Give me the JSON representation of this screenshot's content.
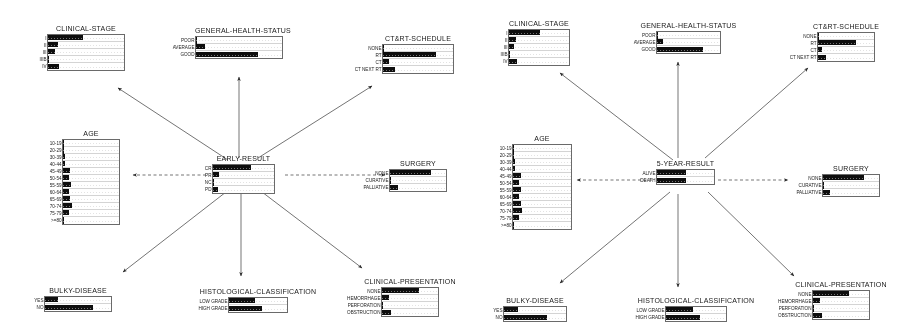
{
  "chart_data": {
    "type": "bar",
    "grid": false,
    "legend_position": "none",
    "panels": [
      {
        "panel_id": "early-result-network",
        "center_node": "EARLY-RESULT",
        "nodes": [
          {
            "name": "CLINICAL-STAGE",
            "categories": [
              "I",
              "II",
              "III",
              "IIIB",
              "IV"
            ],
            "values": [
              0.46,
              0.13,
              0.09,
              0.02,
              0.14
            ],
            "ylim": [
              0,
              1
            ]
          },
          {
            "name": "GENERAL-HEALTH-STATUS",
            "categories": [
              "POOR",
              "AVERAGE",
              "GOOD"
            ],
            "values": [
              0.02,
              0.1,
              0.72
            ],
            "ylim": [
              0,
              1
            ]
          },
          {
            "name": "CT&RT-SCHEDULE",
            "categories": [
              "NONE",
              "RT",
              "CT",
              "CT NEXT RT"
            ],
            "values": [
              0.02,
              0.76,
              0.09,
              0.17
            ],
            "ylim": [
              0,
              1
            ]
          },
          {
            "name": "AGE",
            "categories": [
              "10-19",
              "20-29",
              "30-39",
              "40-44",
              "45-49",
              "50-54",
              "55-59",
              "60-64",
              "65-69",
              "70-74",
              "75-79",
              ">=80"
            ],
            "values": [
              0.02,
              0.02,
              0.04,
              0.04,
              0.13,
              0.11,
              0.14,
              0.1,
              0.13,
              0.16,
              0.1,
              0.02
            ],
            "ylim": [
              0,
              1
            ]
          },
          {
            "name": "EARLY-RESULT",
            "categories": [
              "CR",
              "PR",
              "NC",
              "PD"
            ],
            "values": [
              0.62,
              0.1,
              0.03,
              0.09
            ],
            "ylim": [
              0,
              1
            ]
          },
          {
            "name": "SURGERY",
            "categories": [
              "NONE",
              "CURATIVE",
              "PALLIATIVE"
            ],
            "values": [
              0.74,
              0.03,
              0.14
            ],
            "ylim": [
              0,
              1
            ]
          },
          {
            "name": "BULKY-DISEASE",
            "categories": [
              "YES",
              "NO"
            ],
            "values": [
              0.2,
              0.72
            ],
            "ylim": [
              0,
              1
            ]
          },
          {
            "name": "HISTOLOGICAL-CLASSIFICATION",
            "categories": [
              "LOW GRADE",
              "HIGH GRADE"
            ],
            "values": [
              0.45,
              0.57
            ],
            "ylim": [
              0,
              1
            ]
          },
          {
            "name": "CLINICAL-PRESENTATION",
            "categories": [
              "NONE",
              "HEMORRHAGE",
              "PERFORATION",
              "OBSTRUCTION"
            ],
            "values": [
              0.66,
              0.13,
              0.02,
              0.16
            ],
            "ylim": [
              0,
              1
            ]
          }
        ]
      },
      {
        "panel_id": "five-year-result-network",
        "center_node": "5-YEAR-RESULT",
        "nodes": [
          {
            "name": "CLINICAL-STAGE",
            "categories": [
              "I",
              "II",
              "III",
              "IIIB",
              "IV"
            ],
            "values": [
              0.52,
              0.12,
              0.09,
              0.02,
              0.14
            ],
            "ylim": [
              0,
              1
            ]
          },
          {
            "name": "GENERAL-HEALTH-STATUS",
            "categories": [
              "POOR",
              "AVERAGE",
              "GOOD"
            ],
            "values": [
              0.02,
              0.09,
              0.73
            ],
            "ylim": [
              0,
              1
            ]
          },
          {
            "name": "CT&RT-SCHEDULE",
            "categories": [
              "NONE",
              "RT",
              "CT",
              "CT NEXT RT"
            ],
            "values": [
              0.02,
              0.67,
              0.08,
              0.15
            ],
            "ylim": [
              0,
              1
            ]
          },
          {
            "name": "AGE",
            "categories": [
              "10-19",
              "20-29",
              "30-39",
              "40-44",
              "45-49",
              "50-54",
              "55-59",
              "60-64",
              "65-69",
              "70-74",
              "75-79",
              ">=80"
            ],
            "values": [
              0.02,
              0.02,
              0.04,
              0.04,
              0.13,
              0.11,
              0.14,
              0.1,
              0.13,
              0.16,
              0.1,
              0.02
            ],
            "ylim": [
              0,
              1
            ]
          },
          {
            "name": "5-YEAR-RESULT",
            "categories": [
              "ALIVE",
              "DEATH"
            ],
            "values": [
              0.5,
              0.5
            ],
            "ylim": [
              0,
              1
            ]
          },
          {
            "name": "SURGERY",
            "categories": [
              "NONE",
              "CURATIVE",
              "PALLIATIVE"
            ],
            "values": [
              0.74,
              0.03,
              0.13
            ],
            "ylim": [
              0,
              1
            ]
          },
          {
            "name": "BULKY-DISEASE",
            "categories": [
              "YES",
              "NO"
            ],
            "values": [
              0.22,
              0.7
            ],
            "ylim": [
              0,
              1
            ]
          },
          {
            "name": "HISTOLOGICAL-CLASSIFICATION",
            "categories": [
              "LOW GRADE",
              "HIGH GRADE"
            ],
            "values": [
              0.45,
              0.57
            ],
            "ylim": [
              0,
              1
            ]
          },
          {
            "name": "CLINICAL-PRESENTATION",
            "categories": [
              "NONE",
              "HEMORRHAGE",
              "PERFORATION",
              "OBSTRUCTION"
            ],
            "values": [
              0.64,
              0.13,
              0.02,
              0.16
            ],
            "ylim": [
              0,
              1
            ]
          }
        ]
      }
    ]
  },
  "panels": [
    {
      "id": "left",
      "center": {
        "title": "EARLY-RESULT",
        "rows": [
          {
            "label": "CR",
            "value": 0.62
          },
          {
            "label": "PR",
            "value": 0.1
          },
          {
            "label": "NC",
            "value": 0.03
          },
          {
            "label": "PD",
            "value": 0.09
          }
        ]
      },
      "clinical_stage": {
        "title": "CLINICAL-STAGE",
        "rows": [
          {
            "label": "I",
            "value": 0.46
          },
          {
            "label": "II",
            "value": 0.13
          },
          {
            "label": "III",
            "value": 0.09
          },
          {
            "label": "IIIB",
            "value": 0.02
          },
          {
            "label": "IV",
            "value": 0.14
          }
        ]
      },
      "general_health": {
        "title": "GENERAL-HEALTH-STATUS",
        "rows": [
          {
            "label": "POOR",
            "value": 0.02
          },
          {
            "label": "AVERAGE",
            "value": 0.1
          },
          {
            "label": "GOOD",
            "value": 0.72
          }
        ]
      },
      "ctrt_schedule": {
        "title": "CT&RT-SCHEDULE",
        "rows": [
          {
            "label": "NONE",
            "value": 0.02
          },
          {
            "label": "RT",
            "value": 0.76
          },
          {
            "label": "CT",
            "value": 0.09
          },
          {
            "label": "CT NEXT RT",
            "value": 0.17
          }
        ]
      },
      "age": {
        "title": "AGE",
        "rows": [
          {
            "label": "10-19",
            "value": 0.02
          },
          {
            "label": "20-29",
            "value": 0.02
          },
          {
            "label": "30-39",
            "value": 0.04
          },
          {
            "label": "40-44",
            "value": 0.04
          },
          {
            "label": "45-49",
            "value": 0.13
          },
          {
            "label": "50-54",
            "value": 0.11
          },
          {
            "label": "55-59",
            "value": 0.14
          },
          {
            "label": "60-64",
            "value": 0.1
          },
          {
            "label": "65-69",
            "value": 0.13
          },
          {
            "label": "70-74",
            "value": 0.16
          },
          {
            "label": "75-79",
            "value": 0.1
          },
          {
            "label": ">=80",
            "value": 0.02
          }
        ]
      },
      "surgery": {
        "title": "SURGERY",
        "rows": [
          {
            "label": "NONE",
            "value": 0.74
          },
          {
            "label": "CURATIVE",
            "value": 0.03
          },
          {
            "label": "PALLIATIVE",
            "value": 0.14
          }
        ]
      },
      "bulky_disease": {
        "title": "BULKY-DISEASE",
        "rows": [
          {
            "label": "YES",
            "value": 0.2
          },
          {
            "label": "NO",
            "value": 0.72
          }
        ]
      },
      "histological": {
        "title": "HISTOLOGICAL-CLASSIFICATION",
        "rows": [
          {
            "label": "LOW GRADE",
            "value": 0.45
          },
          {
            "label": "HIGH GRADE",
            "value": 0.57
          }
        ]
      },
      "clinical_presentation": {
        "title": "CLINICAL-PRESENTATION",
        "rows": [
          {
            "label": "NONE",
            "value": 0.66
          },
          {
            "label": "HEMORRHAGE",
            "value": 0.13
          },
          {
            "label": "PERFORATION",
            "value": 0.02
          },
          {
            "label": "OBSTRUCTION",
            "value": 0.16
          }
        ]
      }
    },
    {
      "id": "right",
      "center": {
        "title": "5-YEAR-RESULT",
        "rows": [
          {
            "label": "ALIVE",
            "value": 0.5
          },
          {
            "label": "DEATH",
            "value": 0.5
          }
        ]
      },
      "clinical_stage": {
        "title": "CLINICAL-STAGE",
        "rows": [
          {
            "label": "I",
            "value": 0.52
          },
          {
            "label": "II",
            "value": 0.12
          },
          {
            "label": "III",
            "value": 0.09
          },
          {
            "label": "IIIB",
            "value": 0.02
          },
          {
            "label": "IV",
            "value": 0.14
          }
        ]
      },
      "general_health": {
        "title": "GENERAL-HEALTH-STATUS",
        "rows": [
          {
            "label": "POOR",
            "value": 0.02
          },
          {
            "label": "AVERAGE",
            "value": 0.09
          },
          {
            "label": "GOOD",
            "value": 0.73
          }
        ]
      },
      "ctrt_schedule": {
        "title": "CT&RT-SCHEDULE",
        "rows": [
          {
            "label": "NONE",
            "value": 0.02
          },
          {
            "label": "RT",
            "value": 0.67
          },
          {
            "label": "CT",
            "value": 0.08
          },
          {
            "label": "CT NEXT RT",
            "value": 0.15
          }
        ]
      },
      "age": {
        "title": "AGE",
        "rows": [
          {
            "label": "10-19",
            "value": 0.02
          },
          {
            "label": "20-29",
            "value": 0.02
          },
          {
            "label": "30-39",
            "value": 0.04
          },
          {
            "label": "40-44",
            "value": 0.04
          },
          {
            "label": "45-49",
            "value": 0.13
          },
          {
            "label": "50-54",
            "value": 0.11
          },
          {
            "label": "55-59",
            "value": 0.14
          },
          {
            "label": "60-64",
            "value": 0.1
          },
          {
            "label": "65-69",
            "value": 0.13
          },
          {
            "label": "70-74",
            "value": 0.16
          },
          {
            "label": "75-79",
            "value": 0.1
          },
          {
            "label": ">=80",
            "value": 0.02
          }
        ]
      },
      "surgery": {
        "title": "SURGERY",
        "rows": [
          {
            "label": "NONE",
            "value": 0.74
          },
          {
            "label": "CURATIVE",
            "value": 0.03
          },
          {
            "label": "PALLIATIVE",
            "value": 0.13
          }
        ]
      },
      "bulky_disease": {
        "title": "BULKY-DISEASE",
        "rows": [
          {
            "label": "YES",
            "value": 0.22
          },
          {
            "label": "NO",
            "value": 0.7
          }
        ]
      },
      "histological": {
        "title": "HISTOLOGICAL-CLASSIFICATION",
        "rows": [
          {
            "label": "LOW GRADE",
            "value": 0.45
          },
          {
            "label": "HIGH GRADE",
            "value": 0.57
          }
        ]
      },
      "clinical_presentation": {
        "title": "CLINICAL-PRESENTATION",
        "rows": [
          {
            "label": "NONE",
            "value": 0.64
          },
          {
            "label": "HEMORRHAGE",
            "value": 0.13
          },
          {
            "label": "PERFORATION",
            "value": 0.02
          },
          {
            "label": "OBSTRUCTION",
            "value": 0.16
          }
        ]
      }
    }
  ],
  "style": {
    "bar_color": "#101010",
    "border_color": "#6a6a6a",
    "background_color": "#ffffff",
    "edge_color": "#3a3a3a"
  }
}
